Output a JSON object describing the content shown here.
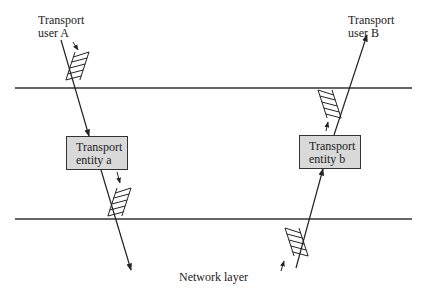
{
  "labels": {
    "user_a": [
      "Transport",
      "user A"
    ],
    "user_b": [
      "Transport",
      "user B"
    ],
    "entity_a": [
      "Transport",
      "entity a"
    ],
    "entity_b": [
      "Transport",
      "entity b"
    ],
    "network_layer": "Network layer"
  },
  "colors": {
    "line": "#222222",
    "box_fill": "#d9d9d9",
    "box_border": "#333333"
  }
}
